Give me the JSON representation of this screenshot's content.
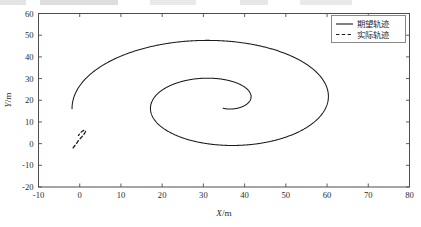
{
  "figure": {
    "type": "line-chart-figure",
    "background_color": "#ffffff",
    "axis_color": "#4d4d4d",
    "curve_color": "#1a1a1a"
  },
  "chart_data": {
    "type": "line",
    "title": "",
    "subtitle": "",
    "xlabel": "X/m",
    "ylabel": "Y/m",
    "xlim": [
      -10,
      80
    ],
    "ylim": [
      -20,
      60
    ],
    "xticks": [
      "-10",
      "0",
      "10",
      "20",
      "30",
      "40",
      "50",
      "60",
      "70",
      "80"
    ],
    "xtick_values": [
      -10,
      0,
      10,
      20,
      30,
      40,
      50,
      60,
      70,
      80
    ],
    "yticks": [
      "-20",
      "-10",
      "0",
      "10",
      "20",
      "30",
      "40",
      "50",
      "60"
    ],
    "ytick_values": [
      -20,
      -10,
      0,
      10,
      20,
      30,
      40,
      50,
      60
    ],
    "grid": false,
    "box": true,
    "legend_position": "upper right",
    "legend": [
      {
        "label": "期望轨迹",
        "style": "solid",
        "color": "#1a1a1a"
      },
      {
        "label": "实际轨迹",
        "style": "dashed",
        "color": "#1a1a1a"
      }
    ],
    "series": [
      {
        "name": "期望轨迹",
        "style": "solid",
        "color": "#1a1a1a",
        "description": "Outward Archimedean spiral starting near origin, winding counter-clockwise outward to a maximum radius of about 36 m, centred near (34, 19).",
        "spiral_model": {
          "center_x": 34.0,
          "center_y": 19.0,
          "r_start": 3.0,
          "r_end": 36.0,
          "theta_start_deg": -75,
          "theta_end_deg": 545,
          "x_scale": 1.0,
          "y_scale": 0.92
        },
        "key_points": [
          {
            "x": 1.0,
            "y": 5.0
          },
          {
            "x": -1.6,
            "y": 16.6
          },
          {
            "x": 8.0,
            "y": 36.0
          },
          {
            "x": 31.5,
            "y": 51.5
          },
          {
            "x": 56.0,
            "y": 45.0
          },
          {
            "x": 69.8,
            "y": 25.0
          },
          {
            "x": 69.0,
            "y": 17.5
          },
          {
            "x": 52.0,
            "y": -8.0
          },
          {
            "x": 38.0,
            "y": -13.8
          },
          {
            "x": 22.0,
            "y": -10.0
          },
          {
            "x": 16.4,
            "y": 1.5
          },
          {
            "x": 17.0,
            "y": 14.5
          },
          {
            "x": 24.0,
            "y": 25.0
          },
          {
            "x": 34.0,
            "y": 27.8
          },
          {
            "x": 45.0,
            "y": 23.0
          },
          {
            "x": 48.8,
            "y": 14.0
          },
          {
            "x": 44.0,
            "y": 4.5
          },
          {
            "x": 36.0,
            "y": 1.2
          },
          {
            "x": 31.5,
            "y": 2.0
          }
        ]
      },
      {
        "name": "实际轨迹",
        "style": "dashed",
        "color": "#1a1a1a",
        "description": "Short dashed segment near the origin rising from lower-left to upper-right, then curving back down; the actual trajectory converges onto the desired spiral.",
        "key_points": [
          {
            "x": -1.6,
            "y": -2.0
          },
          {
            "x": -0.9,
            "y": -0.2
          },
          {
            "x": -0.2,
            "y": 1.6
          },
          {
            "x": 0.5,
            "y": 3.1
          },
          {
            "x": 1.0,
            "y": 4.3
          },
          {
            "x": 1.4,
            "y": 5.6
          },
          {
            "x": 1.1,
            "y": 6.2
          },
          {
            "x": 0.4,
            "y": 5.4
          },
          {
            "x": -0.3,
            "y": 3.8
          }
        ]
      }
    ]
  }
}
